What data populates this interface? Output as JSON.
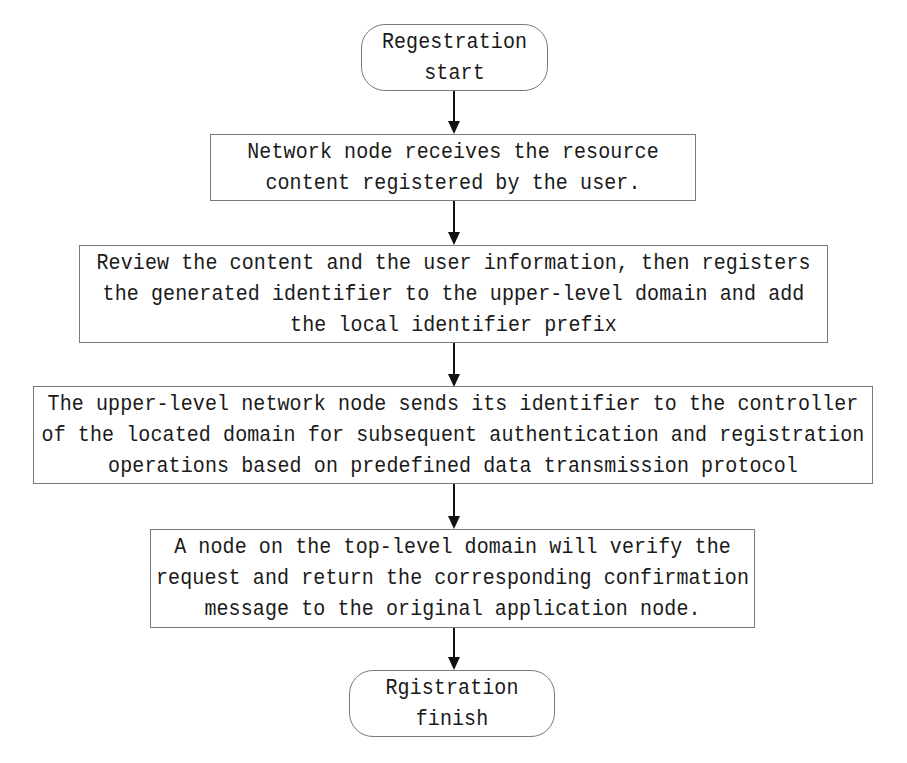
{
  "flowchart": {
    "start": {
      "lines": [
        "Regestration",
        "start"
      ]
    },
    "steps": [
      {
        "lines": [
          "Network node receives the resource",
          "content registered by the user."
        ]
      },
      {
        "lines": [
          "Review the content and the user information, then registers",
          "the generated identifier to the upper-level domain and add",
          "the local identifier prefix"
        ]
      },
      {
        "lines": [
          "The upper-level network node sends its identifier to the controller",
          "of the located domain for subsequent authentication and registration",
          "operations based on predefined data transmission protocol"
        ]
      },
      {
        "lines": [
          "A node on the top-level domain will verify the",
          "request and return the corresponding confirmation",
          "message to the original application node."
        ]
      }
    ],
    "end": {
      "lines": [
        "Rgistration",
        "finish"
      ]
    }
  },
  "colors": {
    "border": "#7a7a7a",
    "arrow": "#111111",
    "text": "#1a1a1a",
    "background": "#ffffff"
  }
}
